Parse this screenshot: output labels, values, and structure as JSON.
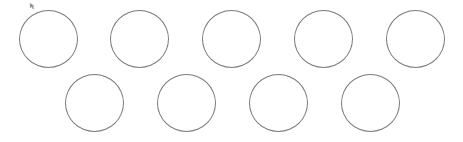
{
  "canvas": {
    "background": "#ffffff",
    "stroke_color": "#7a7a7a",
    "circles": [
      {
        "row": 1,
        "index": 1,
        "left": 19,
        "top": 10
      },
      {
        "row": 1,
        "index": 2,
        "left": 110,
        "top": 10
      },
      {
        "row": 1,
        "index": 3,
        "left": 202,
        "top": 10
      },
      {
        "row": 1,
        "index": 4,
        "left": 294,
        "top": 10
      },
      {
        "row": 1,
        "index": 5,
        "left": 386,
        "top": 10
      },
      {
        "row": 2,
        "index": 1,
        "left": 65,
        "top": 74
      },
      {
        "row": 2,
        "index": 2,
        "left": 157,
        "top": 74
      },
      {
        "row": 2,
        "index": 3,
        "left": 249,
        "top": 74
      },
      {
        "row": 2,
        "index": 4,
        "left": 341,
        "top": 74
      }
    ]
  },
  "cursor": {
    "icon": "mouse-pointer-icon",
    "x": 29,
    "y": 2
  }
}
